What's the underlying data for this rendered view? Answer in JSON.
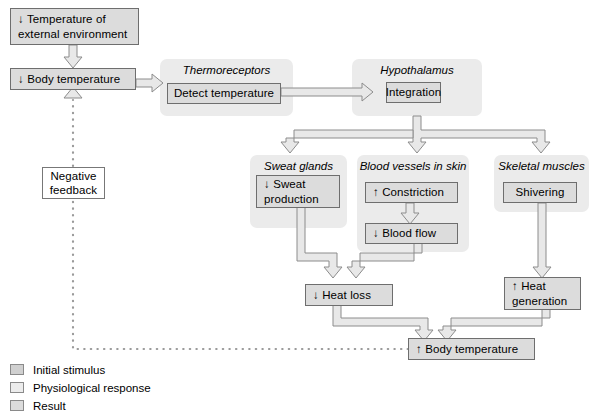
{
  "diagram": {
    "colors": {
      "panel_background": "#ebebeb",
      "node_fill": "#dcdcdc",
      "node_border": "#6e6e6e",
      "white_node_fill": "#ffffff",
      "arrow_fill": "#e8e8e8",
      "arrow_stroke": "#8c8c8c",
      "dotted_line": "#9a9a9a",
      "text": "#000000"
    }
  },
  "nodes": {
    "external_temp": {
      "line1": "↓ Temperature of",
      "line2": "external environment"
    },
    "body_temp_low": {
      "label": "↓ Body temperature"
    },
    "negative_feedback": {
      "line1": "Negative",
      "line2": "feedback"
    },
    "detect_temperature": {
      "label": "Detect temperature"
    },
    "integration": {
      "label": "Integration"
    },
    "sweat_production": {
      "line1": "↓ Sweat",
      "line2": "production"
    },
    "constriction": {
      "label": "↑ Constriction"
    },
    "blood_flow": {
      "label": "↓ Blood flow"
    },
    "shivering": {
      "label": "Shivering"
    },
    "heat_loss": {
      "label": "↓ Heat loss"
    },
    "heat_generation": {
      "line1": "↑ Heat",
      "line2": "generation"
    },
    "body_temp_high": {
      "label": "↑ Body temperature"
    }
  },
  "panels": {
    "thermoreceptors": {
      "title": "Thermoreceptors"
    },
    "hypothalamus": {
      "title": "Hypothalamus"
    },
    "sweat_glands": {
      "title": "Sweat glands"
    },
    "blood_vessels": {
      "title": "Blood vessels in skin"
    },
    "skeletal_muscles": {
      "title": "Skeletal muscles"
    }
  },
  "legend": {
    "items": [
      {
        "label": "Initial stimulus",
        "color": "#d0d0d0"
      },
      {
        "label": "Physiological response",
        "color": "#ececec"
      },
      {
        "label": "Result",
        "color": "#dcdcdc"
      }
    ]
  }
}
